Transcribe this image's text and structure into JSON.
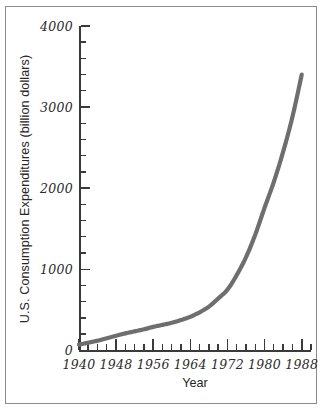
{
  "chart_data": {
    "type": "line",
    "title": "",
    "xlabel": "Year",
    "ylabel": "U.S. Consumption Expenditures (billion dollars)",
    "xlim": [
      1940,
      1990
    ],
    "ylim": [
      0,
      4000
    ],
    "grid": false,
    "legend": null,
    "line_color": "#6e6e6e",
    "axis_color": "#3a3a3a",
    "x_major_ticks": [
      1940,
      1948,
      1956,
      1964,
      1972,
      1980,
      1988
    ],
    "x_major_tick_labels": [
      "1940",
      "1948",
      "1956",
      "1964",
      "1972",
      "1980",
      "1988"
    ],
    "x_minor_tick_interval": 2,
    "y_major_ticks": [
      0,
      1000,
      2000,
      3000,
      4000
    ],
    "y_major_tick_labels": [
      "0",
      "1000",
      "2000",
      "3000",
      "4000"
    ],
    "y_minor_tick_interval": 200,
    "series": [
      {
        "name": "U.S. Consumption Expenditures",
        "x": [
          1940,
          1942,
          1944,
          1946,
          1948,
          1950,
          1952,
          1954,
          1956,
          1958,
          1960,
          1962,
          1964,
          1966,
          1968,
          1970,
          1972,
          1974,
          1976,
          1978,
          1980,
          1982,
          1984,
          1986,
          1988
        ],
        "values": [
          72,
          95,
          120,
          150,
          180,
          210,
          235,
          260,
          290,
          315,
          340,
          375,
          415,
          470,
          540,
          640,
          750,
          930,
          1150,
          1430,
          1760,
          2080,
          2450,
          2880,
          3400
        ]
      }
    ]
  },
  "axis": {
    "y_labels": [
      "4000",
      "3000",
      "2000",
      "1000",
      "0"
    ],
    "x_labels": [
      "1940",
      "1948",
      "1956",
      "1964",
      "1972",
      "1980",
      "1988"
    ],
    "y_title": "U.S. Consumption Expenditures (billion dollars)",
    "x_title": "Year"
  }
}
